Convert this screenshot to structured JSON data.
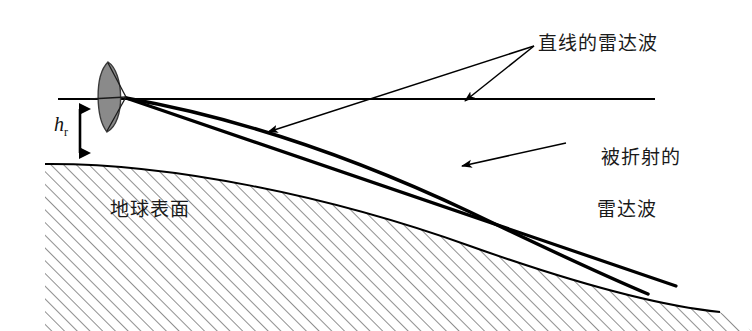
{
  "figure": {
    "title_text": "",
    "background_color": "#ffffff",
    "line_color": "#000000",
    "dish_fill_color": "#8a8a8a",
    "hatch_color": "#333333"
  },
  "labels": {
    "straight_wave": "直线的雷达波",
    "refracted_wave_line1": "被折射的",
    "refracted_wave_line2": "雷达波",
    "earth_surface": "地球表面",
    "antenna_height_symbol": "h",
    "antenna_height_subscript": "r"
  },
  "elements": {
    "antenna_name": "parabolic-dish-antenna",
    "horizontal_reference_line": "horizon-line",
    "straight_ray": "straight-line-radar-wave-ray",
    "refracted_ray": "refracted-radar-wave-curve",
    "earth_curve": "earth-surface-curve",
    "hatching": "earth-interior-hatching",
    "height_arrow": "antenna-height-double-arrow",
    "leader_straight_a": "leader-line-to-horizon",
    "leader_straight_b": "leader-line-to-straight-ray",
    "leader_refracted": "leader-line-to-refracted-curve"
  },
  "geometry": {
    "canvas_width": 752,
    "canvas_height": 331,
    "antenna_vertex": [
      125,
      97
    ],
    "horizon_line": [
      [
        58,
        99
      ],
      [
        655,
        99
      ]
    ],
    "height_marker_x": 80,
    "height_marker_top_y": 99,
    "height_marker_bottom_y": 163
  }
}
